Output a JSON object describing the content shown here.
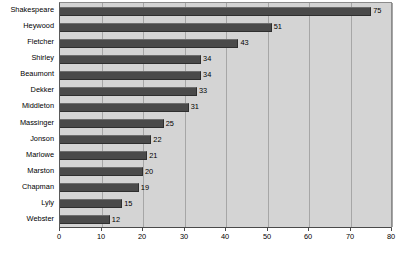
{
  "chart_data": {
    "type": "bar",
    "orientation": "horizontal",
    "title": "",
    "xlabel": "",
    "ylabel": "",
    "categories": [
      "Shakespeare",
      "Heywood",
      "Fletcher",
      "Shirley",
      "Beaumont",
      "Dekker",
      "Middleton",
      "Massinger",
      "Jonson",
      "Marlowe",
      "Marston",
      "Chapman",
      "Lyly",
      "Webster"
    ],
    "values": [
      75,
      51,
      43,
      34,
      34,
      33,
      31,
      25,
      22,
      21,
      20,
      19,
      15,
      12
    ],
    "value_labels": [
      "75",
      "51",
      "43",
      "34",
      "34",
      "33",
      "31",
      "25",
      "22",
      "21",
      "20",
      "19",
      "15",
      "12"
    ],
    "xlim": [
      0,
      80
    ],
    "xticks": [
      0,
      10,
      20,
      30,
      40,
      50,
      60,
      70,
      80
    ],
    "xtick_labels": [
      "0",
      "10",
      "20",
      "30",
      "40",
      "50",
      "60",
      "70",
      "80"
    ],
    "grid": true,
    "grid_axis": "x",
    "legend": false,
    "bar_color": "#4a4a4a",
    "plot_background": "#d4d4d4",
    "figure_background": "#ffffff"
  }
}
